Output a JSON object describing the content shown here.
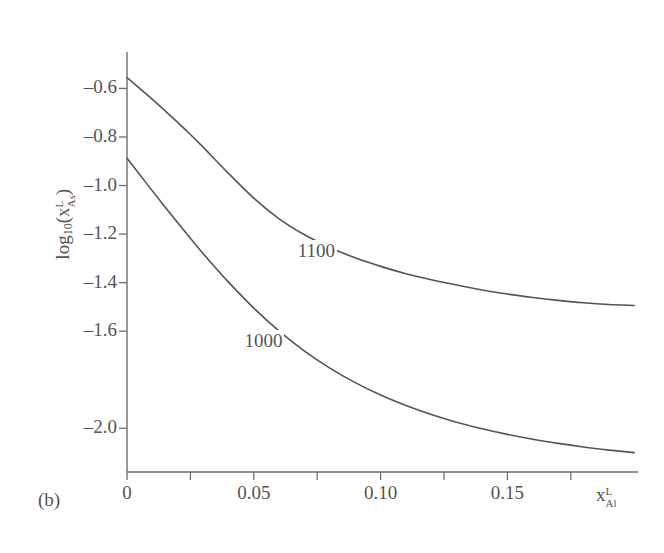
{
  "figure": {
    "panel_label": "(b)",
    "background": "#ffffff",
    "ink_color": "#545454"
  },
  "chart_data": {
    "type": "line",
    "title": "",
    "subtitle": "",
    "xlabel": "x_Al^L",
    "xlabel_parts": {
      "base": "x",
      "sub": "Al",
      "sup": "L"
    },
    "ylabel": "log10(x_As^L)",
    "ylabel_parts": {
      "base": "log",
      "base_sub": "10",
      "arg": "x",
      "arg_sub": "As",
      "arg_sup": "L"
    },
    "xlim": [
      0,
      0.2015
    ],
    "ylim": [
      -2.18,
      -0.45
    ],
    "grid": false,
    "legend": "inline-curve-labels",
    "xticks": [
      0,
      0.05,
      0.1,
      0.15
    ],
    "xticklabels": [
      "0",
      "0.05",
      "0.10",
      "0.15"
    ],
    "xminorticks": [
      0.025,
      0.075,
      0.125,
      0.175
    ],
    "yticks": [
      -0.6,
      -0.8,
      -1.0,
      -1.2,
      -1.4,
      -1.6,
      -2.0
    ],
    "yticklabels": [
      "–0.6",
      "–0.8",
      "–1.0",
      "–1.2",
      "–1.4",
      "–1.6",
      "–2.0"
    ],
    "series": [
      {
        "name": "1100",
        "label": "1100",
        "label_x": 0.0665,
        "label_y": -1.275,
        "color": "#545454",
        "x": [
          0.0,
          0.005,
          0.01,
          0.015,
          0.02,
          0.025,
          0.03,
          0.035,
          0.04,
          0.05,
          0.06,
          0.07,
          0.08,
          0.09,
          0.1,
          0.11,
          0.12,
          0.13,
          0.14,
          0.15,
          0.16,
          0.17,
          0.18,
          0.19,
          0.2
        ],
        "y": [
          -0.555,
          -0.6,
          -0.645,
          -0.692,
          -0.74,
          -0.79,
          -0.842,
          -0.896,
          -0.95,
          -1.052,
          -1.137,
          -1.203,
          -1.255,
          -1.298,
          -1.333,
          -1.363,
          -1.388,
          -1.41,
          -1.43,
          -1.447,
          -1.461,
          -1.473,
          -1.483,
          -1.49,
          -1.494
        ]
      },
      {
        "name": "1000",
        "label": "1000",
        "label_x": 0.0455,
        "label_y": -1.645,
        "color": "#545454",
        "x": [
          0.0,
          0.005,
          0.01,
          0.015,
          0.02,
          0.025,
          0.03,
          0.035,
          0.04,
          0.05,
          0.06,
          0.07,
          0.08,
          0.09,
          0.1,
          0.11,
          0.12,
          0.13,
          0.14,
          0.15,
          0.16,
          0.17,
          0.18,
          0.19,
          0.2
        ],
        "y": [
          -0.888,
          -0.955,
          -1.022,
          -1.088,
          -1.153,
          -1.217,
          -1.28,
          -1.34,
          -1.398,
          -1.505,
          -1.6,
          -1.682,
          -1.752,
          -1.812,
          -1.863,
          -1.906,
          -1.943,
          -1.975,
          -2.002,
          -2.025,
          -2.045,
          -2.062,
          -2.077,
          -2.09,
          -2.1
        ]
      }
    ]
  }
}
